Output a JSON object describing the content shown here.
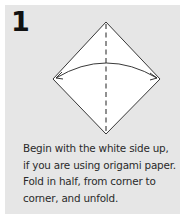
{
  "step": {
    "number": "1",
    "instruction_lines": [
      "Begin with the white side up,",
      "if you are using origami paper.",
      "Fold in half, from corner to",
      "corner, and unfold."
    ]
  },
  "diagram": {
    "shape": "diamond-square",
    "fold_line": "vertical-dashed-valley-fold",
    "arrow": "fold-and-unfold-arc-left-to-right",
    "colors": {
      "panel_bg": "#e6e6e6",
      "paper": "#ffffff",
      "line": "#222222"
    }
  }
}
